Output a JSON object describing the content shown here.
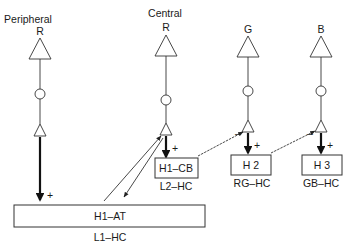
{
  "diagram": {
    "title_labels": {
      "peripheral": "Peripheral",
      "central": "Central"
    },
    "photoreceptors": [
      {
        "id": "R-peripheral",
        "label": "R",
        "x": 40
      },
      {
        "id": "R-central",
        "label": "R",
        "x": 166
      },
      {
        "id": "G",
        "label": "G",
        "x": 247
      },
      {
        "id": "B",
        "label": "B",
        "x": 321
      }
    ],
    "cells": [
      {
        "id": "h1-at",
        "label": "H1–AT",
        "sublabel": "L1–HC"
      },
      {
        "id": "h1-cb",
        "label": "H1–CB",
        "sublabel": "L2–HC"
      },
      {
        "id": "h2",
        "label": "H 2",
        "sublabel": "RG–HC"
      },
      {
        "id": "h3",
        "label": "H 3",
        "sublabel": "GB–HC"
      }
    ],
    "signs": {
      "plus": "+",
      "minus": "–"
    },
    "colors": {
      "stroke": "#333333",
      "text": "#1a1a1a",
      "background": "#ffffff"
    }
  }
}
